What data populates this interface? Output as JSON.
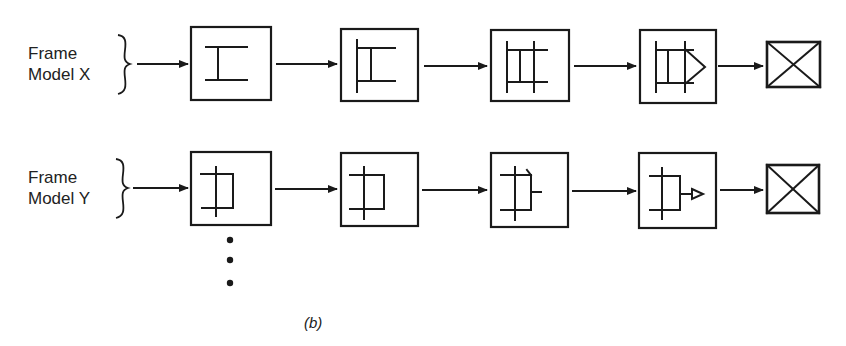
{
  "rows": [
    {
      "id": "x",
      "label_line1": "Frame",
      "label_line2": "Model X",
      "stages": [
        "stage-1-i-beam",
        "stage-2-partial-frame",
        "stage-3-grid-frame",
        "stage-4-arrow-frame",
        "final-x-box"
      ]
    },
    {
      "id": "y",
      "label_line1": "Frame",
      "label_line2": "Model Y",
      "stages": [
        "stage-1-bracket",
        "stage-2-bracket",
        "stage-3-bracket-tab",
        "stage-4-bracket-arrow",
        "final-x-box"
      ]
    }
  ],
  "continuation": "⋮",
  "caption": "(b)",
  "colors": {
    "ink": "#1a1a1a",
    "background": "#ffffff"
  }
}
